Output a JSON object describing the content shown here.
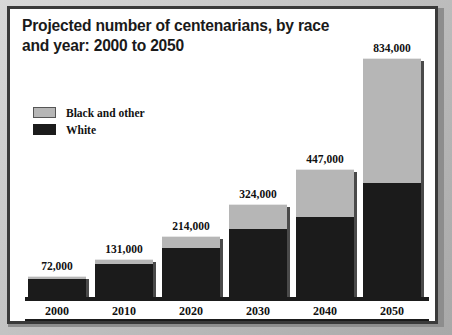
{
  "chart_data": {
    "type": "bar",
    "subtype": "stacked-column",
    "title": "Projected number of centenarians, by race\nand year: 2000 to 2050",
    "xlabel": "",
    "ylabel": "",
    "grid": false,
    "legend_position": "upper-left",
    "categories": [
      "2000",
      "2010",
      "2020",
      "2030",
      "2040",
      "2050"
    ],
    "totals": [
      72000,
      131000,
      214000,
      324000,
      447000,
      834000
    ],
    "total_labels": [
      "72,000",
      "131,000",
      "214,000",
      "324,000",
      "447,000",
      "834,000"
    ],
    "series": [
      {
        "name": "White",
        "color": "#1b1b1b",
        "values": [
          64000,
          115000,
          170000,
          236000,
          280000,
          397000
        ]
      },
      {
        "name": "Black and other",
        "color": "#b6b6b6",
        "values": [
          8000,
          16000,
          44000,
          88000,
          167000,
          437000
        ]
      }
    ],
    "ylim": [
      0,
      900000
    ],
    "axis_baseline": 0
  },
  "legend": {
    "items": [
      {
        "label": "Black and other",
        "swatch": "gray"
      },
      {
        "label": "White",
        "swatch": "black"
      }
    ]
  },
  "colors": {
    "black_segment": "#1b1b1b",
    "gray_segment": "#b6b6b6",
    "frame": "#3a3a3a",
    "background": "#ffffff",
    "outer": "#c0c0c0"
  }
}
